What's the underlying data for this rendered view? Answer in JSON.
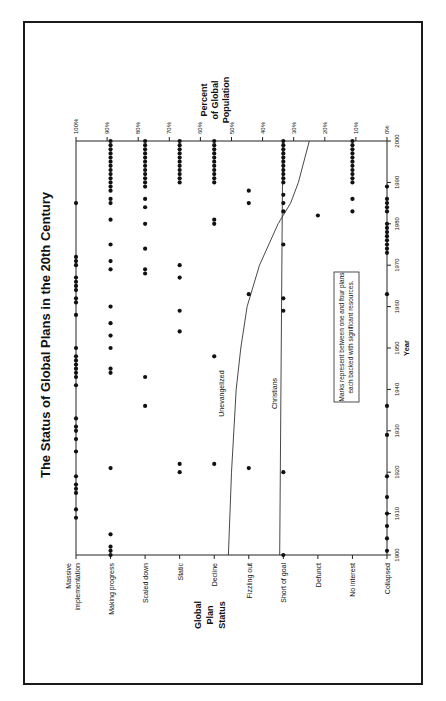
{
  "chart_data": {
    "type": "scatter",
    "orientation": "rotated-90-ccw",
    "title": "The Status of Global Plans in the 20th Century",
    "xlabel": "Year",
    "ylabel_left": "Global Plan Status",
    "ylabel_right": "Percent of Global Population",
    "x_ticks": [
      "1900",
      "1910",
      "1920",
      "1930",
      "1940",
      "1950",
      "1960",
      "1970",
      "1980",
      "1990",
      "2000"
    ],
    "xlim": [
      1900,
      2000
    ],
    "status_categories": [
      "Massive implementation",
      "Making progress",
      "Scaled down",
      "Static",
      "Decline",
      "Fizzling out",
      "Short of goal",
      "Defunct",
      "No interest",
      "Collapsed"
    ],
    "percent_ticks": [
      "100%",
      "90%",
      "80%",
      "70%",
      "60%",
      "50%",
      "40%",
      "30%",
      "20%",
      "10%",
      "0%"
    ],
    "note": "Marks represent between one and four plans each backed with significant resources.",
    "series": [
      {
        "name": "Massive implementation",
        "years": [
          1909,
          1911,
          1915,
          1916,
          1917,
          1919,
          1925,
          1928,
          1930,
          1931,
          1933,
          1941,
          1943,
          1944,
          1945,
          1946,
          1947,
          1948,
          1950,
          1958,
          1961,
          1962,
          1964,
          1965,
          1966,
          1967,
          1970,
          1971,
          1972,
          1985
        ]
      },
      {
        "name": "Making progress",
        "years": [
          1900,
          1901,
          1902,
          1905,
          1921,
          1944,
          1945,
          1950,
          1953,
          1956,
          1960,
          1969,
          1971,
          1975,
          1981,
          1985,
          1986,
          1988,
          1989,
          1990,
          1991,
          1992,
          1993,
          1994,
          1995,
          1996,
          1997,
          1998,
          1999,
          2000
        ]
      },
      {
        "name": "Scaled down",
        "years": [
          1936,
          1943,
          1968,
          1969,
          1974,
          1980,
          1984,
          1986,
          1989,
          1990,
          1991,
          1992,
          1993,
          1994,
          1995,
          1996,
          1997,
          1998,
          1999,
          2000
        ]
      },
      {
        "name": "Static",
        "years": [
          1920,
          1922,
          1954,
          1959,
          1967,
          1970,
          1990,
          1991,
          1992,
          1993,
          1994,
          1995,
          1996,
          1997,
          1998,
          1999,
          2000
        ]
      },
      {
        "name": "Decline",
        "years": [
          1922,
          1948,
          1980,
          1981,
          1990,
          1991,
          1992,
          1993,
          1994,
          1995,
          1996,
          1997,
          1998,
          1999,
          2000
        ]
      },
      {
        "name": "Fizzling out",
        "years": [
          1921,
          1963,
          1985,
          1988
        ]
      },
      {
        "name": "Short of goal",
        "years": [
          1900,
          1920,
          1959,
          1962,
          1975,
          1983,
          1985,
          1987,
          1990,
          1991,
          1992,
          1993,
          1994,
          1995,
          1996,
          1997,
          1998,
          1999,
          2000
        ]
      },
      {
        "name": "Defunct",
        "years": [
          1982
        ]
      },
      {
        "name": "No interest",
        "years": [
          1983,
          1986,
          1990,
          1991,
          1992,
          1993,
          1994,
          1995,
          1996,
          1997,
          1998,
          1999,
          2000
        ]
      },
      {
        "name": "Collapsed",
        "years": [
          1901,
          1904,
          1907,
          1910,
          1914,
          1919,
          1929,
          1936,
          1963,
          1973,
          1974,
          1975,
          1976,
          1977,
          1978,
          1979,
          1980,
          1983,
          1984,
          1985,
          1986,
          1989
        ]
      }
    ],
    "lines": [
      {
        "name": "Unevangelized",
        "x": [
          1900,
          1920,
          1940,
          1950,
          1960,
          1970,
          1980,
          1985,
          1990,
          2000
        ],
        "percent": [
          51,
          50,
          48.5,
          47,
          45,
          41,
          35,
          31,
          28.5,
          25
        ]
      },
      {
        "name": "Christians",
        "x": [
          1900,
          2000
        ],
        "percent": [
          34.5,
          33.5
        ]
      }
    ],
    "grid": false,
    "legend": "inline labels"
  },
  "labels": {
    "title": "The Status of Global Plans in the 20th Century",
    "percent_axis_title": [
      "Percent",
      "of Global",
      "Population"
    ],
    "status_axis_title": [
      "Global",
      "Plan",
      "Status"
    ],
    "year_axis_title": "Year",
    "unevangelized": "Unevangelized",
    "christians": "Christians",
    "note_line1": "Marks represent between one and four plans",
    "note_line2": "each backed with significant resources."
  }
}
